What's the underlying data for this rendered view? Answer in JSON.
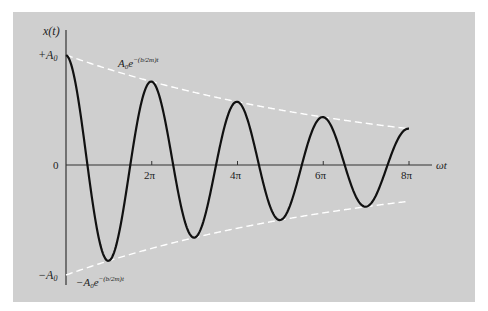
{
  "chart_data": {
    "type": "line",
    "title": "",
    "xlabel": "ωt",
    "ylabel": "x(t)",
    "x_ticks": [
      "2π",
      "4π",
      "6π",
      "8π"
    ],
    "x_tick_values": [
      6.2832,
      12.5664,
      18.8496,
      25.1327
    ],
    "y_ticks": [
      "+A₀",
      "0",
      "−A₀"
    ],
    "y_tick_values": [
      1,
      0,
      -1
    ],
    "xlim": [
      0,
      25.13
    ],
    "ylim": [
      -1,
      1
    ],
    "grid": false,
    "series": [
      {
        "name": "x(t) damped oscillation",
        "style": "solid black",
        "function": "e^{-0.044 ωt} cos(ωt)",
        "points_x": [
          0,
          3.14,
          6.28,
          9.42,
          12.57,
          15.71,
          18.85,
          21.99,
          25.13
        ],
        "points_y": [
          1.0,
          -0.76,
          0.58,
          -0.44,
          0.33,
          -0.25,
          0.19,
          -0.15,
          0.33
        ]
      },
      {
        "name": "upper envelope",
        "style": "dashed white",
        "label": "A₀e^{−(b/2m)t}",
        "points_x": [
          0,
          25.13
        ],
        "points_y": [
          1.0,
          0.33
        ]
      },
      {
        "name": "lower envelope",
        "style": "dashed white",
        "label": "−A₀e^{−(b/2m)t}",
        "points_x": [
          0,
          25.13
        ],
        "points_y": [
          -1.0,
          -0.33
        ]
      }
    ],
    "annotations": [
      "A₀e^{−(b/2m)t}",
      "−A₀e^{−(b/2m)t}"
    ]
  },
  "labels": {
    "ylabel": "x(t)",
    "xlabel": "ωt",
    "plus_a0_main": "+A",
    "minus_a0_main": "−A",
    "sub0": "0",
    "zero": "0",
    "tick_2pi": "2π",
    "tick_4pi": "4π",
    "tick_6pi": "6π",
    "tick_8pi": "8π",
    "upper_env_base": "A",
    "upper_env_e": "e",
    "upper_env_exp": "−(b/2m)t",
    "lower_env_base": "−A",
    "lower_env_e": "e",
    "lower_env_exp": "−(b/2m)t"
  },
  "colors": {
    "panel": "#cfcfcf",
    "curve": "#111111",
    "envelope": "#ffffff",
    "axis": "#333333"
  }
}
